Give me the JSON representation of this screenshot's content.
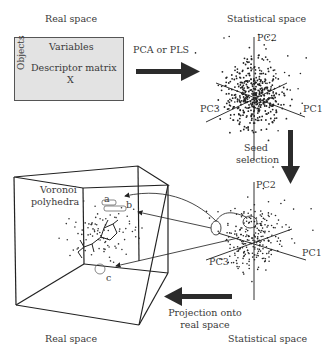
{
  "top_left": {
    "heading": "Real space",
    "matrix": {
      "columns_label": "Variables",
      "rows_label": "Objects",
      "title": "Descriptor matrix",
      "symbol": "X"
    }
  },
  "top_right": {
    "heading": "Statistical space",
    "axes": [
      "PC1",
      "PC2",
      "PC3"
    ]
  },
  "arrows": {
    "top": "PCA or PLS",
    "right": "Seed selection",
    "bottom_line1": "Projection onto",
    "bottom_line2": "real space"
  },
  "bottom_left": {
    "heading": "Real space",
    "cube_label_line1": "Voronoi",
    "cube_label_line2": "polyhedra",
    "markers": [
      "a",
      "b",
      "c"
    ]
  },
  "bottom_right": {
    "heading": "Statistical space",
    "axes": [
      "PC1",
      "PC2",
      "PC3"
    ]
  },
  "colors": {
    "matrix_fill": "#e3e3e3",
    "arrow": "#2b2b2b",
    "points": "#222222"
  }
}
